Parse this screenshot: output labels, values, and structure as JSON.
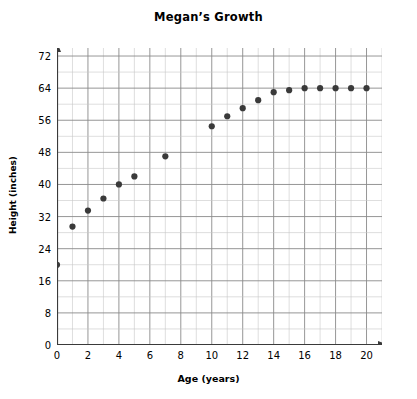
{
  "chart_data": {
    "type": "scatter",
    "title": "Megan’s Growth",
    "xlabel": "Age (years)",
    "ylabel": "Height (inches)",
    "xlim": [
      0,
      21
    ],
    "ylim": [
      0,
      74
    ],
    "xticks": [
      0,
      2,
      4,
      6,
      8,
      10,
      12,
      14,
      16,
      18,
      20
    ],
    "yticks": [
      0,
      8,
      16,
      24,
      32,
      40,
      48,
      56,
      64,
      72
    ],
    "grid": true,
    "grid_minor_x_step": 1,
    "grid_minor_y_step": 4,
    "legend": "none",
    "marker_color": "#3a3a3a",
    "axis_color": "#3a3a3a",
    "grid_major_color": "#8a8a8a",
    "grid_minor_color": "#c8c8c8",
    "x": [
      0,
      1,
      2,
      3,
      4,
      5,
      7,
      10,
      11,
      12,
      13,
      14,
      15,
      16,
      17,
      18,
      19,
      20
    ],
    "values": [
      20,
      29.5,
      33.5,
      36.5,
      40,
      42,
      47,
      54.5,
      57,
      59,
      61,
      63,
      63.5,
      64,
      64,
      64,
      64,
      64
    ],
    "points": [
      {
        "age": 0,
        "height": 20
      },
      {
        "age": 1,
        "height": 29.5
      },
      {
        "age": 2,
        "height": 33.5
      },
      {
        "age": 3,
        "height": 36.5
      },
      {
        "age": 4,
        "height": 40
      },
      {
        "age": 5,
        "height": 42
      },
      {
        "age": 7,
        "height": 47
      },
      {
        "age": 10,
        "height": 54.5
      },
      {
        "age": 11,
        "height": 57
      },
      {
        "age": 12,
        "height": 59
      },
      {
        "age": 13,
        "height": 61
      },
      {
        "age": 14,
        "height": 63
      },
      {
        "age": 15,
        "height": 63.5
      },
      {
        "age": 16,
        "height": 64
      },
      {
        "age": 17,
        "height": 64
      },
      {
        "age": 18,
        "height": 64
      },
      {
        "age": 19,
        "height": 64
      },
      {
        "age": 20,
        "height": 64
      }
    ]
  }
}
